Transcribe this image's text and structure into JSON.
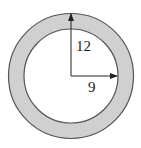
{
  "diagram": {
    "type": "annulus",
    "outer_radius_label": "12",
    "inner_radius_label": "9",
    "colors": {
      "ring_fill": "#d0d0d0",
      "inner_fill": "#ffffff",
      "stroke": "#555555",
      "arrow": "#222222"
    }
  }
}
